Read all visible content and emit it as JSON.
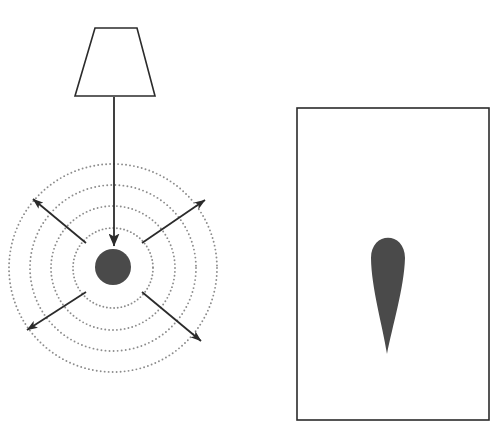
{
  "scene": {
    "title": "Light source wavefront emission diagram",
    "width": 498,
    "height": 444,
    "background_color": "#ffffff",
    "stroke_color": "#2b2b2b",
    "fill_color": "#4a4a4a",
    "dotted_color": "#8c8c8c"
  },
  "left_panel": {
    "name": "light-source-panel",
    "lamp": {
      "label": "lamp-shade",
      "shape": "trapezoid",
      "top_left_x": 95,
      "top_right_x": 137,
      "top_y": 28,
      "bottom_left_x": 75,
      "bottom_right_x": 155,
      "bottom_y": 96,
      "stroke_width": 1.6
    },
    "beam_arrow": {
      "label": "downward-beam-arrow",
      "from_x": 114,
      "from_y": 97,
      "to_x": 114,
      "to_y": 246,
      "stroke_width": 1.8
    },
    "source": {
      "label": "point-source-disc",
      "center_x": 113,
      "center_y": 267,
      "radius": 18,
      "fill": "#4a4a4a"
    },
    "wavefronts": {
      "label": "concentric-wavefront-circles",
      "center_x": 113,
      "center_y": 268,
      "count": 4,
      "radii": [
        40,
        62,
        83,
        104
      ],
      "style": "dotted",
      "dot_radius": 0.95,
      "dot_spacing_deg": [
        5.2,
        3.6,
        2.8,
        2.2
      ]
    },
    "ray_arrows": {
      "label": "radiating-ray-arrows",
      "count": 4,
      "rays": [
        {
          "name": "ray-upper-left",
          "from_x": 86,
          "from_y": 243,
          "to_x": 33,
          "to_y": 199
        },
        {
          "name": "ray-upper-right",
          "from_x": 142,
          "from_y": 243,
          "to_x": 205,
          "to_y": 200
        },
        {
          "name": "ray-lower-left",
          "from_x": 86,
          "from_y": 292,
          "to_x": 27,
          "to_y": 330
        },
        {
          "name": "ray-lower-right",
          "from_x": 142,
          "from_y": 292,
          "to_x": 201,
          "to_y": 341
        }
      ],
      "stroke_width": 1.8,
      "arrow_head_length": 11,
      "arrow_head_width": 7
    }
  },
  "right_panel": {
    "name": "flame-frame-panel",
    "frame": {
      "label": "rectangular-border",
      "x": 297,
      "y": 108,
      "width": 192,
      "height": 312,
      "stroke_width": 1.6,
      "fill": "none"
    },
    "flame": {
      "label": "flame-teardrop-shape",
      "description": "inverted teardrop, rounded top tapering to a point at bottom",
      "top_center_x": 388,
      "top_center_y": 258,
      "bulb_radius_x": 17,
      "bulb_radius_y": 20,
      "tip_x": 387,
      "tip_y": 354,
      "fill": "#4a4a4a"
    }
  }
}
